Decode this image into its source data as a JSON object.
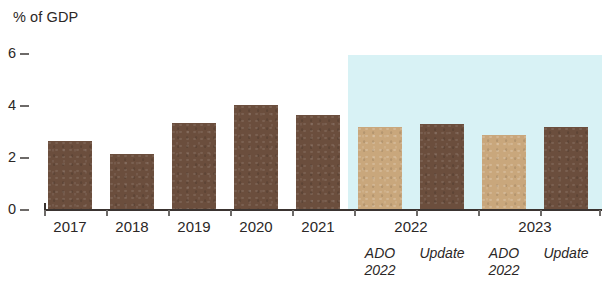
{
  "chart_data": {
    "type": "bar",
    "title": "",
    "ylabel": "% of GDP",
    "xlabel": "",
    "ylim": [
      0,
      6
    ],
    "yticks": [
      0,
      2,
      4,
      6
    ],
    "ytick_labels": [
      "0",
      "2",
      "4",
      "6"
    ],
    "grid": false,
    "legend": false,
    "categories": [
      "2017",
      "2018",
      "2019",
      "2020",
      "2021",
      "2022 ADO 2022",
      "2022 Update",
      "2023 ADO 2022",
      "2023 Update"
    ],
    "values": [
      2.65,
      2.15,
      3.35,
      4.05,
      3.65,
      3.2,
      3.3,
      2.9,
      3.2
    ],
    "bars": [
      {
        "label": "2017",
        "sublabel": "",
        "value": 2.65,
        "color": "#6b4e3d",
        "style": "dark",
        "forecast": false
      },
      {
        "label": "2018",
        "sublabel": "",
        "value": 2.15,
        "color": "#6b4e3d",
        "style": "dark",
        "forecast": false
      },
      {
        "label": "2019",
        "sublabel": "",
        "value": 3.35,
        "color": "#6b4e3d",
        "style": "dark",
        "forecast": false
      },
      {
        "label": "2020",
        "sublabel": "",
        "value": 4.05,
        "color": "#6b4e3d",
        "style": "dark",
        "forecast": false
      },
      {
        "label": "2021",
        "sublabel": "",
        "value": 3.65,
        "color": "#6b4e3d",
        "style": "dark",
        "forecast": false
      },
      {
        "label": "",
        "sublabel": "ADO\n2022",
        "value": 3.2,
        "color": "#c9a77c",
        "style": "light",
        "forecast": true
      },
      {
        "label": "",
        "sublabel": "Update",
        "value": 3.3,
        "color": "#6b4e3d",
        "style": "dark",
        "forecast": true
      },
      {
        "label": "",
        "sublabel": "ADO\n2022",
        "value": 2.9,
        "color": "#c9a77c",
        "style": "light",
        "forecast": true
      },
      {
        "label": "",
        "sublabel": "Update",
        "value": 3.2,
        "color": "#6b4e3d",
        "style": "dark",
        "forecast": true
      }
    ],
    "group_labels": [
      {
        "text": "2017"
      },
      {
        "text": "2018"
      },
      {
        "text": "2019"
      },
      {
        "text": "2020"
      },
      {
        "text": "2021"
      },
      {
        "text": "2022"
      },
      {
        "text": "2023"
      }
    ],
    "sub_labels": [
      {
        "line1": "ADO",
        "line2": "2022"
      },
      {
        "line1": "Update",
        "line2": ""
      },
      {
        "line1": "ADO",
        "line2": "2022"
      },
      {
        "line1": "Update",
        "line2": ""
      }
    ],
    "colors": {
      "bar_dark": "#6b4e3d",
      "bar_light": "#c9a77c",
      "forecast_band": "#d8f2f5",
      "axis": "#3a3330",
      "text": "#2b2726"
    },
    "annotations": [
      {
        "name": "forecast-shading",
        "description": "light blue band covering 2022 and 2023 projection bars"
      }
    ]
  }
}
